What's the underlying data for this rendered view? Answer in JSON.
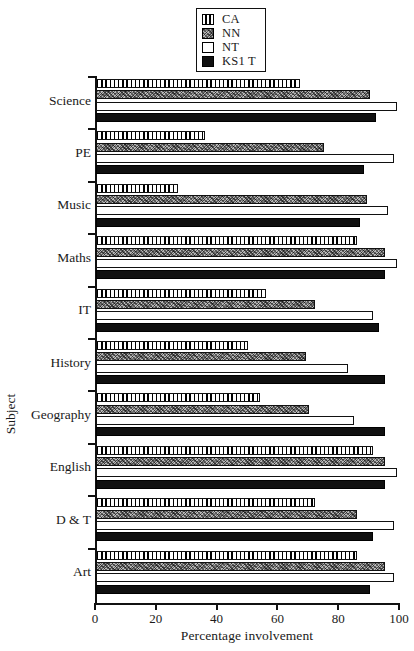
{
  "chart_data": {
    "type": "bar",
    "orientation": "horizontal",
    "title": "",
    "xlabel": "Percentage involvement",
    "ylabel": "Subject",
    "xlim": [
      0,
      100
    ],
    "xticks": [
      0,
      20,
      40,
      60,
      80,
      100
    ],
    "grid": false,
    "legend_position": "top-center",
    "categories": [
      "Science",
      "PE",
      "Music",
      "Maths",
      "IT",
      "History",
      "Geography",
      "English",
      "D & T",
      "Art"
    ],
    "series": [
      {
        "name": "CA",
        "pattern": "vertical-stripes",
        "color": "#ffffff",
        "values": [
          67,
          36,
          27,
          86,
          56,
          50,
          54,
          91,
          72,
          86
        ]
      },
      {
        "name": "NN",
        "pattern": "stipple-gray",
        "color": "#b9b9b9",
        "values": [
          90,
          75,
          89,
          95,
          72,
          69,
          70,
          95,
          86,
          95
        ]
      },
      {
        "name": "NT",
        "pattern": "solid-white",
        "color": "#ffffff",
        "values": [
          99,
          98,
          96,
          99,
          91,
          83,
          85,
          99,
          98,
          98
        ]
      },
      {
        "name": "KS1 T",
        "pattern": "solid-black",
        "color": "#101010",
        "values": [
          92,
          88,
          87,
          95,
          93,
          95,
          95,
          95,
          91,
          90
        ]
      }
    ]
  },
  "legend": {
    "items": [
      {
        "label": "CA",
        "swatch": "vertical-stripes"
      },
      {
        "label": "NN",
        "swatch": "stipple-gray"
      },
      {
        "label": "NT",
        "swatch": "solid-white"
      },
      {
        "label": "KS1 T",
        "swatch": "solid-black"
      }
    ]
  },
  "axes": {
    "x": {
      "label": "Percentage involvement",
      "ticks": [
        "0",
        "20",
        "40",
        "60",
        "80",
        "100"
      ]
    },
    "y": {
      "label": "Subject",
      "ticks": [
        "Science",
        "PE",
        "Music",
        "Maths",
        "IT",
        "History",
        "Geography",
        "English",
        "D & T",
        "Art"
      ]
    }
  }
}
